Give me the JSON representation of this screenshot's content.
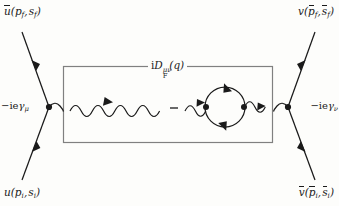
{
  "figure": {
    "kind": "feynman-diagram",
    "background_color": "#fdfdfb",
    "line_color": "#1a1a1a",
    "box_border_color": "#808080"
  },
  "labels": {
    "incoming_electron": "u(pᵢ, sᵢ)",
    "outgoing_electron": "ū(p_f, s_f)",
    "incoming_positron": "v̄(p̄ᵢ, s̄ᵢ)",
    "outgoing_positron": "v(p̄_f, s̄_f)",
    "vertex_left": "−ieγμ",
    "vertex_right": "−ieγν",
    "propagator": "iD_F^{μν}(q)",
    "minus_sign": "–"
  },
  "parts": {
    "u_bar_f": {
      "fn": "u",
      "overline": true,
      "args": [
        "p",
        "s"
      ],
      "sub": "f"
    },
    "u_i": {
      "fn": "u",
      "overline": false,
      "args": [
        "p",
        "s"
      ],
      "sub": "i"
    },
    "v_f": {
      "fn": "v",
      "overline": false,
      "arg_overline": true,
      "args": [
        "p",
        "s"
      ],
      "sub": "f"
    },
    "v_bar_i": {
      "fn": "v",
      "overline": true,
      "arg_overline": true,
      "args": [
        "p",
        "s"
      ],
      "sub": "i"
    },
    "charge": "−ie",
    "gamma": "γ",
    "mu": "μ",
    "nu": "ν",
    "prop_i": "i",
    "prop_D": "D",
    "prop_sub": "F",
    "prop_sup": "μν",
    "prop_arg": "(q)"
  },
  "geometry": {
    "box": {
      "x": 63,
      "y": 66,
      "width": 209,
      "height": 76
    },
    "vertex_left": {
      "x": 49,
      "y": 107
    },
    "vertex_right": {
      "x": 288,
      "y": 107
    },
    "loop_center": {
      "x": 225,
      "y": 107
    },
    "loop_radius": 20,
    "loop_vertex_left": {
      "x": 206,
      "y": 107
    },
    "loop_vertex_right": {
      "x": 244,
      "y": 107
    }
  }
}
